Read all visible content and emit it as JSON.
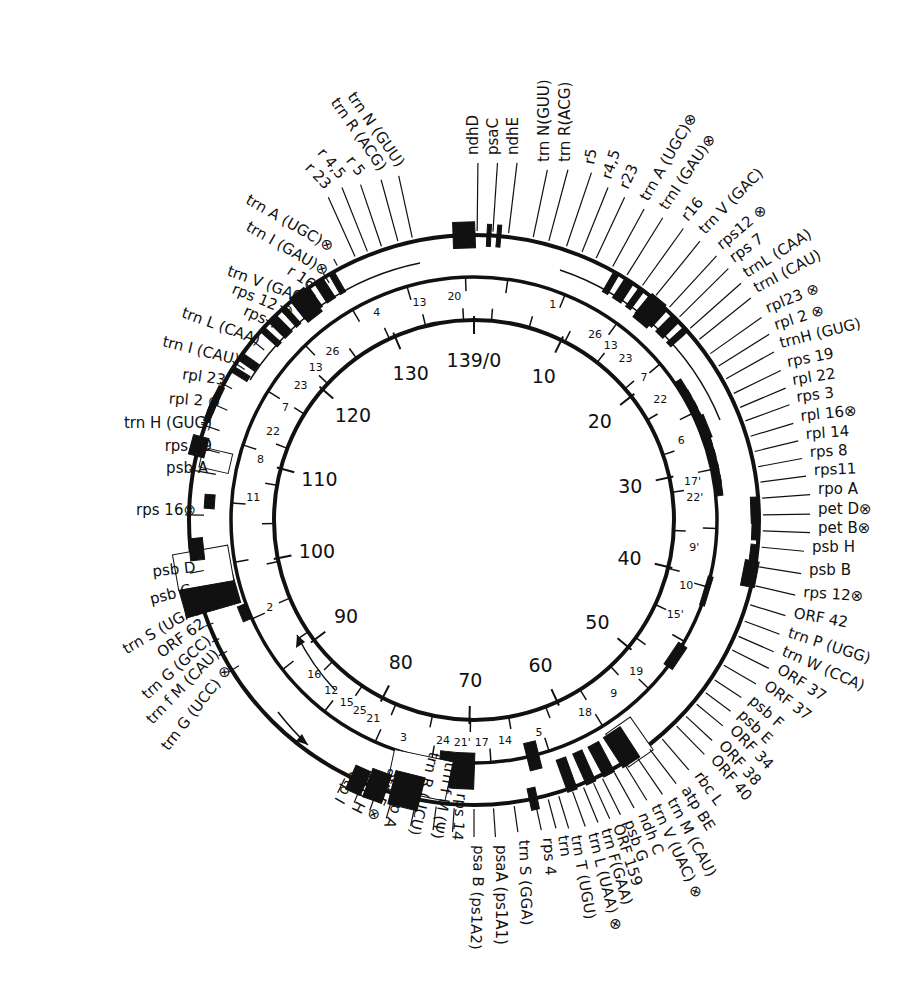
{
  "figure": {
    "center": [
      474,
      520
    ],
    "rings": {
      "inner_radius": 200,
      "middle_radius": 243,
      "outer_radius": 285
    },
    "accent": "#111111"
  },
  "coordinate_ring": {
    "ticks": [
      {
        "pos": 0,
        "label": "139/0"
      },
      {
        "pos": 10,
        "label": "10"
      },
      {
        "pos": 20,
        "label": "20"
      },
      {
        "pos": 30,
        "label": "30"
      },
      {
        "pos": 40,
        "label": "40"
      },
      {
        "pos": 50,
        "label": "50"
      },
      {
        "pos": 60,
        "label": "60"
      },
      {
        "pos": 70,
        "label": "70"
      },
      {
        "pos": 80,
        "label": "80"
      },
      {
        "pos": 90,
        "label": "90"
      },
      {
        "pos": 100,
        "label": "100"
      },
      {
        "pos": 110,
        "label": "110"
      },
      {
        "pos": 120,
        "label": "120"
      },
      {
        "pos": 130,
        "label": "130"
      }
    ],
    "total": 139
  },
  "fragment_labels": [
    {
      "angle": -14,
      "r": 225,
      "text": "13"
    },
    {
      "angle": -5,
      "r": 225,
      "text": "20"
    },
    {
      "angle": -25,
      "r": 230,
      "text": "4"
    },
    {
      "angle": 20,
      "r": 230,
      "text": "1"
    },
    {
      "angle": -40,
      "r": 220,
      "text": "26"
    },
    {
      "angle": -46,
      "r": 220,
      "text": "13"
    },
    {
      "angle": -52,
      "r": 220,
      "text": "23"
    },
    {
      "angle": -59,
      "r": 220,
      "text": "7"
    },
    {
      "angle": -66,
      "r": 220,
      "text": "22"
    },
    {
      "angle": -74,
      "r": 222,
      "text": "8"
    },
    {
      "angle": -84,
      "r": 222,
      "text": "11"
    },
    {
      "angle": -113,
      "r": 222,
      "text": "2"
    },
    {
      "angle": -134,
      "r": 222,
      "text": "16"
    },
    {
      "angle": -140,
      "r": 222,
      "text": "12"
    },
    {
      "angle": -145,
      "r": 222,
      "text": "15"
    },
    {
      "angle": -149,
      "r": 222,
      "text": "25"
    },
    {
      "angle": -153,
      "r": 222,
      "text": "21"
    },
    {
      "angle": -162,
      "r": 228,
      "text": "3"
    },
    {
      "angle": -172,
      "r": 222,
      "text": "24"
    },
    {
      "angle": -177,
      "r": 222,
      "text": "21'"
    },
    {
      "angle": 178,
      "r": 222,
      "text": "17"
    },
    {
      "angle": 172,
      "r": 222,
      "text": "14"
    },
    {
      "angle": 163,
      "r": 222,
      "text": "5"
    },
    {
      "angle": 150,
      "r": 222,
      "text": "18"
    },
    {
      "angle": 141,
      "r": 222,
      "text": "9"
    },
    {
      "angle": 133,
      "r": 222,
      "text": "19"
    },
    {
      "angle": 115,
      "r": 222,
      "text": "15'"
    },
    {
      "angle": 107,
      "r": 222,
      "text": "10"
    },
    {
      "angle": 97,
      "r": 222,
      "text": "9'"
    },
    {
      "angle": 84,
      "r": 222,
      "text": "22'"
    },
    {
      "angle": 80,
      "r": 222,
      "text": "17'"
    },
    {
      "angle": 69,
      "r": 222,
      "text": "6"
    },
    {
      "angle": 57,
      "r": 222,
      "text": "22"
    },
    {
      "angle": 50,
      "r": 222,
      "text": "7"
    },
    {
      "angle": 43,
      "r": 222,
      "text": "23"
    },
    {
      "angle": 38,
      "r": 222,
      "text": "13"
    },
    {
      "angle": 33,
      "r": 222,
      "text": "26"
    }
  ],
  "gene_labels": {
    "top": [
      {
        "text": "ndhD",
        "x": 478,
        "y": 155,
        "rot": -90
      },
      {
        "text": "psaC",
        "x": 498,
        "y": 155,
        "rot": -90
      },
      {
        "text": "ndhE",
        "x": 518,
        "y": 155,
        "rot": -90
      }
    ],
    "top_right": [
      {
        "text": "trn N(GUU)",
        "x": 549,
        "y": 162,
        "rot": -90
      },
      {
        "text": "trn R(ACG)",
        "x": 570,
        "y": 162,
        "rot": -90
      },
      {
        "text": "r5",
        "x": 594,
        "y": 165,
        "rot": -80
      },
      {
        "text": "r4,5",
        "x": 611,
        "y": 180,
        "rot": -72
      },
      {
        "text": "r23",
        "x": 628,
        "y": 190,
        "rot": -66
      },
      {
        "text": "trn A (UGC)⊗",
        "x": 648,
        "y": 202,
        "rot": -60
      },
      {
        "text": "trnI (GAU)⊗",
        "x": 667,
        "y": 211,
        "rot": -56
      },
      {
        "text": "r16",
        "x": 688,
        "y": 222,
        "rot": -50
      },
      {
        "text": "trn V (GAC)",
        "x": 705,
        "y": 235,
        "rot": -46
      },
      {
        "text": "rps12 ⊗",
        "x": 722,
        "y": 250,
        "rot": -40
      },
      {
        "text": "rps 7",
        "x": 734,
        "y": 263,
        "rot": -36
      },
      {
        "text": "trnL (CAA)",
        "x": 747,
        "y": 278,
        "rot": -32
      },
      {
        "text": "trnI (CAU)",
        "x": 757,
        "y": 293,
        "rot": -28
      }
    ],
    "right": [
      {
        "text": "rpl23 ⊗",
        "x": 768,
        "y": 313,
        "rot": -22
      },
      {
        "text": "rpl 2 ⊗",
        "x": 776,
        "y": 330,
        "rot": -18
      },
      {
        "text": "trnH (GUG)",
        "x": 781,
        "y": 348,
        "rot": -14
      },
      {
        "text": "rps 19",
        "x": 788,
        "y": 367,
        "rot": -11
      },
      {
        "text": "rpl  22",
        "x": 793,
        "y": 385,
        "rot": -9
      },
      {
        "text": "rps 3",
        "x": 797,
        "y": 402,
        "rot": -7
      },
      {
        "text": "rpl  16⊗",
        "x": 801,
        "y": 421,
        "rot": -6
      },
      {
        "text": "rpl 14",
        "x": 806,
        "y": 439,
        "rot": -4
      },
      {
        "text": "rps 8",
        "x": 810,
        "y": 457,
        "rot": -3
      },
      {
        "text": "rps11",
        "x": 814,
        "y": 475,
        "rot": -2
      },
      {
        "text": "rpo A",
        "x": 818,
        "y": 494,
        "rot": 0
      },
      {
        "text": "pet D⊗",
        "x": 818,
        "y": 514,
        "rot": 0
      },
      {
        "text": "pet B⊗",
        "x": 818,
        "y": 533,
        "rot": 0
      },
      {
        "text": "psb H",
        "x": 812,
        "y": 552,
        "rot": 0
      },
      {
        "text": "psb B",
        "x": 809,
        "y": 575,
        "rot": 0
      },
      {
        "text": "rps 12⊗",
        "x": 803,
        "y": 597,
        "rot": 4
      }
    ],
    "bottom_right": [
      {
        "text": "ORF 42",
        "x": 793,
        "y": 618,
        "rot": 10
      },
      {
        "text": "trn P (UGG)",
        "x": 787,
        "y": 637,
        "rot": 18
      },
      {
        "text": "trn W (CCA)",
        "x": 781,
        "y": 655,
        "rot": 24
      },
      {
        "text": "ORF 37",
        "x": 776,
        "y": 672,
        "rot": 33
      },
      {
        "text": "ORF 37",
        "x": 763,
        "y": 688,
        "rot": 37
      },
      {
        "text": "psb F",
        "x": 748,
        "y": 702,
        "rot": 42
      },
      {
        "text": "psb E",
        "x": 737,
        "y": 716,
        "rot": 44
      },
      {
        "text": "ORF 34",
        "x": 729,
        "y": 731,
        "rot": 46
      },
      {
        "text": "ORF 38",
        "x": 718,
        "y": 746,
        "rot": 48
      },
      {
        "text": "ORF 40",
        "x": 710,
        "y": 760,
        "rot": 50
      },
      {
        "text": "rbc L",
        "x": 694,
        "y": 776,
        "rot": 54
      },
      {
        "text": "atp BE",
        "x": 681,
        "y": 790,
        "rot": 58
      },
      {
        "text": "trn M (CAU)",
        "x": 667,
        "y": 801,
        "rot": 62
      },
      {
        "text": "trn V (UAC) ⊗",
        "x": 651,
        "y": 807,
        "rot": 65
      },
      {
        "text": "ndh C",
        "x": 638,
        "y": 815,
        "rot": 68
      },
      {
        "text": "psb G",
        "x": 624,
        "y": 822,
        "rot": 70
      },
      {
        "text": "ORF 159",
        "x": 613,
        "y": 826,
        "rot": 72
      },
      {
        "text": "trn F(GAA)",
        "x": 601,
        "y": 830,
        "rot": 74
      },
      {
        "text": "trn L (UAA) ⊗",
        "x": 588,
        "y": 834,
        "rot": 76
      }
    ],
    "bottom": [
      {
        "text": "trn T (UGU)",
        "x": 571,
        "y": 836,
        "rot": 80
      },
      {
        "text": "trn",
        "x": 558,
        "y": 836,
        "rot": 82
      },
      {
        "text": "rps 4",
        "x": 543,
        "y": 838,
        "rot": 86
      },
      {
        "text": "trn S (GGA)",
        "x": 519,
        "y": 840,
        "rot": 88
      },
      {
        "text": "psaA (ps1A1)",
        "x": 496,
        "y": 845,
        "rot": 90
      },
      {
        "text": "psa B (ps1A2)",
        "x": 474,
        "y": 845,
        "rot": 92
      },
      {
        "text": "rps 14",
        "x": 452,
        "y": 840,
        "rot": 96
      },
      {
        "text": "trn f M (Ψ)",
        "x": 432,
        "y": 838,
        "rot": 100
      },
      {
        "text": "trn R (UCU)",
        "x": 409,
        "y": 834,
        "rot": 104
      },
      {
        "text": "atp A",
        "x": 384,
        "y": 826,
        "rot": 110
      },
      {
        "text": "atp F ⊗",
        "x": 367,
        "y": 818,
        "rot": 114
      },
      {
        "text": "atp H",
        "x": 351,
        "y": 810,
        "rot": 117
      },
      {
        "text": "atp I",
        "x": 334,
        "y": 800,
        "rot": 120
      }
    ],
    "left": [
      {
        "text": "trn A (UGC)⊗",
        "x": 330,
        "y": 252,
        "rot": 30
      },
      {
        "text": "trn I (GAU)⊗",
        "x": 325,
        "y": 276,
        "rot": 30
      },
      {
        "text": "r 16",
        "x": 311,
        "y": 290,
        "rot": 34
      },
      {
        "text": "trn V (GAC)",
        "x": 306,
        "y": 304,
        "rot": 20
      },
      {
        "text": "rps 12 ⊗",
        "x": 291,
        "y": 317,
        "rot": 22
      },
      {
        "text": "rps  7",
        "x": 277,
        "y": 330,
        "rot": 24
      },
      {
        "text": "trn L  (CAA)",
        "x": 258,
        "y": 345,
        "rot": 20
      },
      {
        "text": "trn I (CAU)",
        "x": 238,
        "y": 365,
        "rot": 14
      },
      {
        "text": "rpl  23",
        "x": 225,
        "y": 385,
        "rot": 8
      },
      {
        "text": "rpl  2 ⊗",
        "x": 220,
        "y": 407,
        "rot": 4
      },
      {
        "text": "trn H (GUG)",
        "x": 212,
        "y": 428,
        "rot": 0
      },
      {
        "text": "rps 19",
        "x": 212,
        "y": 451,
        "rot": 0
      },
      {
        "text": "psb A",
        "x": 208,
        "y": 473,
        "rot": 0
      },
      {
        "text": "rps 16⊗",
        "x": 196,
        "y": 515,
        "rot": 0
      },
      {
        "text": "psb D",
        "x": 196,
        "y": 572,
        "rot": -6
      },
      {
        "text": "psb C",
        "x": 192,
        "y": 594,
        "rot": -14
      },
      {
        "text": "trn S (UGA)",
        "x": 200,
        "y": 612,
        "rot": -30
      },
      {
        "text": "ORF 62",
        "x": 206,
        "y": 626,
        "rot": -36
      },
      {
        "text": "trn G (GCC)",
        "x": 212,
        "y": 642,
        "rot": -42
      },
      {
        "text": "trn f M (CAU)",
        "x": 220,
        "y": 655,
        "rot": -46
      },
      {
        "text": "trn G (UCC) ⊗",
        "x": 232,
        "y": 670,
        "rot": -52
      }
    ],
    "top_left_rRNA": [
      {
        "text": "trn N (GUU)",
        "x": 397,
        "y": 168,
        "rot": 55
      },
      {
        "text": "trn R (ACG)",
        "x": 379,
        "y": 172,
        "rot": 55
      },
      {
        "text": "r 5",
        "x": 358,
        "y": 177,
        "rot": 52
      },
      {
        "text": "r 4,5",
        "x": 339,
        "y": 180,
        "rot": 50
      },
      {
        "text": "r 23",
        "x": 325,
        "y": 190,
        "rot": 46
      }
    ]
  },
  "arrows": [
    {
      "name": "inner-direction-arrow",
      "direction": "counterclockwise"
    },
    {
      "name": "outer-direction-arrow",
      "direction": "clockwise"
    }
  ]
}
